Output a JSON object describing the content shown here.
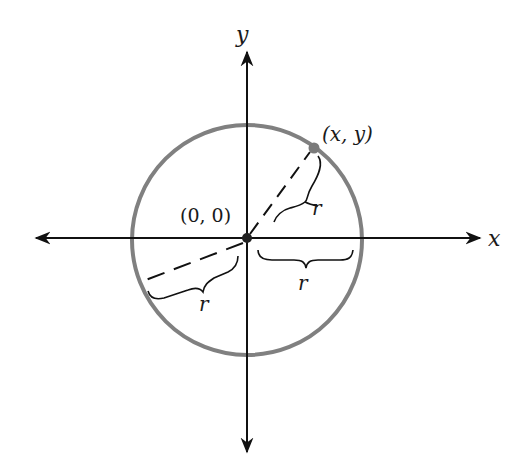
{
  "diagram": {
    "type": "circle-on-coordinate-plane",
    "colors": {
      "axis": "#111111",
      "circle": "#808080",
      "point": "#7a7a7a",
      "text": "#1a1a1a",
      "background": "#ffffff"
    },
    "axes": {
      "x_label": "x",
      "y_label": "y"
    },
    "origin_label": "(0, 0)",
    "point_label": "(x, y)",
    "radius_labels": {
      "to_point": "r",
      "positive_x": "r",
      "lower_left": "r"
    }
  }
}
